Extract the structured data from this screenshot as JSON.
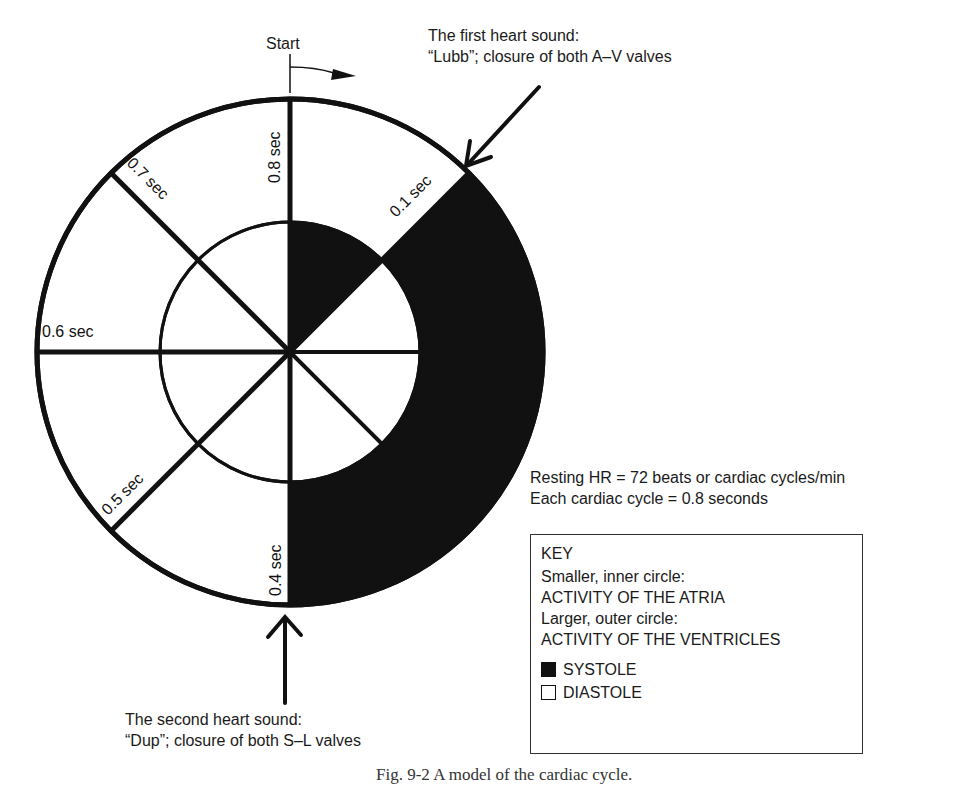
{
  "diagram": {
    "title": "A model of the cardiac cycle",
    "start_label": "Start",
    "first_sound": {
      "line1": "The first heart sound:",
      "line2": "“Lubb”; closure of both A–V valves"
    },
    "second_sound": {
      "line1": "The second heart sound:",
      "line2": "“Dup”; closure of both S–L valves"
    },
    "time_labels": {
      "t01": "0.1 sec",
      "t04": "0.4 sec",
      "t05": "0.5 sec",
      "t06": "0.6 sec",
      "t07": "0.7 sec",
      "t08": "0.8 sec"
    },
    "notes": {
      "heart_rate": "Resting HR = 72 beats or cardiac cycles/min",
      "cycle_length": "Each cardiac cycle = 0.8 seconds"
    },
    "key": {
      "title": "KEY",
      "inner_label": "Smaller, inner circle:",
      "inner_value": "ACTIVITY OF THE ATRIA",
      "outer_label": "Larger, outer circle:",
      "outer_value": "ACTIVITY OF THE VENTRICLES",
      "systole": "SYSTOLE",
      "diastole": "DIASTOLE"
    },
    "caption": "Fig. 9-2  A model of the cardiac cycle.",
    "colors": {
      "systole": "#111111",
      "diastole": "#ffffff",
      "stroke": "#111111"
    },
    "cycle": {
      "total_seconds": 0.8,
      "atrial_systole": [
        0.0,
        0.1
      ],
      "ventricular_systole": [
        0.1,
        0.4
      ],
      "divisions": [
        0.1,
        0.2,
        0.3,
        0.4,
        0.5,
        0.6,
        0.7,
        0.8
      ]
    }
  }
}
